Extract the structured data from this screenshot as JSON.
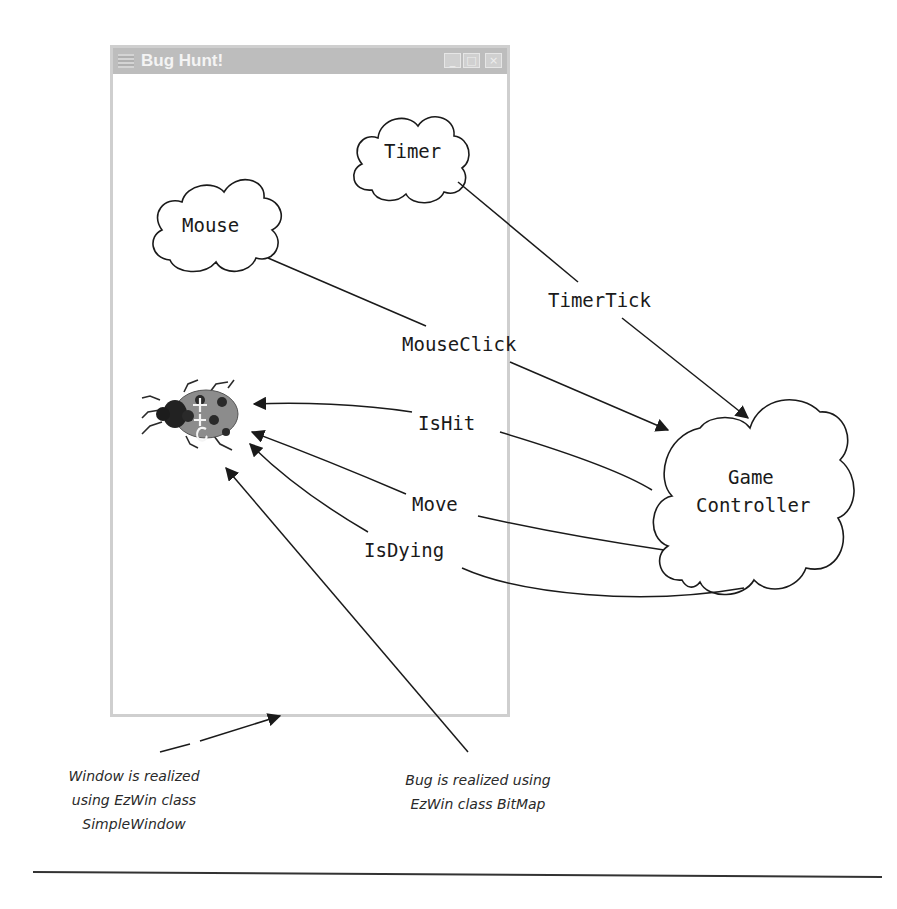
{
  "window": {
    "title": "Bug Hunt!",
    "controls": {
      "minimize": "_",
      "maximize": "□",
      "close": "×"
    }
  },
  "clouds": {
    "timer": "Timer",
    "mouse": "Mouse",
    "controller_line1": "Game",
    "controller_line2": "Controller"
  },
  "messages": {
    "timer_tick": "TimerTick",
    "mouse_click": "MouseClick",
    "is_hit": "IsHit",
    "move": "Move",
    "is_dying": "IsDying"
  },
  "annotations": {
    "window_note": [
      "Window is realized",
      "using EzWin class",
      "SimpleWindow"
    ],
    "bug_note": [
      "Bug is realized using",
      "EzWin class BitMap"
    ]
  },
  "colors": {
    "window_border": "#cfcfcf",
    "titlebar": "#bdbdbd",
    "ink": "#1a1a1a"
  }
}
